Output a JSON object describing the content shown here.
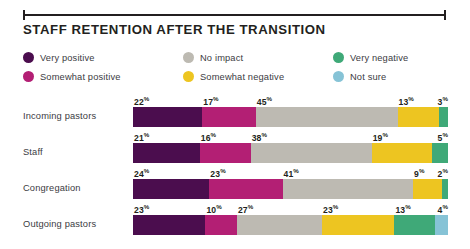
{
  "header": {
    "title": "STAFF RETENTION AFTER THE TRANSITION",
    "rule_color": "#231f20"
  },
  "legend": {
    "columns": [
      {
        "items": [
          {
            "label": "Very positive",
            "color": "#4b0d4e",
            "swatch": "legend-dot-very-positive"
          },
          {
            "label": "Somewhat positive",
            "color": "#b31f74",
            "swatch": "legend-dot-somewhat-positive"
          }
        ]
      },
      {
        "items": [
          {
            "label": "No impact",
            "color": "#bdbab2",
            "swatch": "legend-dot-no-impact"
          },
          {
            "label": "Somewhat negative",
            "color": "#edc521",
            "swatch": "legend-dot-somewhat-negative"
          }
        ]
      },
      {
        "items": [
          {
            "label": "Very negative",
            "color": "#3fa978",
            "swatch": "legend-dot-very-negative"
          },
          {
            "label": "Not sure",
            "color": "#86c3d6",
            "swatch": "legend-dot-not-sure"
          }
        ]
      }
    ]
  },
  "chart_data": {
    "type": "bar",
    "orientation": "horizontal",
    "stacked": true,
    "normalized_percent": true,
    "title": "STAFF RETENTION AFTER THE TRANSITION",
    "xlabel": "",
    "ylabel": "",
    "xlim": [
      0,
      100
    ],
    "grid": false,
    "legend_position": "top",
    "value_suffix": "%",
    "categories": [
      "Incoming pastors",
      "Staff",
      "Congregation",
      "Outgoing pastors"
    ],
    "series": [
      {
        "name": "Very positive",
        "color": "#4b0d4e",
        "values": [
          22,
          21,
          24,
          23
        ]
      },
      {
        "name": "Somewhat positive",
        "color": "#b31f74",
        "values": [
          17,
          16,
          23,
          10
        ]
      },
      {
        "name": "No impact",
        "color": "#bdbab2",
        "values": [
          45,
          38,
          41,
          27
        ]
      },
      {
        "name": "Somewhat negative",
        "color": "#edc521",
        "values": [
          13,
          19,
          9,
          23
        ]
      },
      {
        "name": "Very negative",
        "color": "#3fa978",
        "values": [
          3,
          5,
          2,
          13
        ]
      },
      {
        "name": "Not sure",
        "color": "#86c3d6",
        "values": [
          0,
          0,
          0,
          4
        ]
      }
    ],
    "rows": [
      {
        "label": "Incoming pastors",
        "segments": [
          {
            "name": "Very positive",
            "value": 22,
            "display": "22",
            "color": "#4b0d4e",
            "show_value": true
          },
          {
            "name": "Somewhat positive",
            "value": 17,
            "display": "17",
            "color": "#b31f74",
            "show_value": true
          },
          {
            "name": "No impact",
            "value": 45,
            "display": "45",
            "color": "#bdbab2",
            "show_value": true
          },
          {
            "name": "Somewhat negative",
            "value": 13,
            "display": "13",
            "color": "#edc521",
            "show_value": true
          },
          {
            "name": "Very negative",
            "value": 3,
            "display": "3",
            "color": "#3fa978",
            "show_value": true
          }
        ]
      },
      {
        "label": "Staff",
        "segments": [
          {
            "name": "Very positive",
            "value": 21,
            "display": "21",
            "color": "#4b0d4e",
            "show_value": true
          },
          {
            "name": "Somewhat positive",
            "value": 16,
            "display": "16",
            "color": "#b31f74",
            "show_value": true
          },
          {
            "name": "No impact",
            "value": 38,
            "display": "38",
            "color": "#bdbab2",
            "show_value": true
          },
          {
            "name": "Somewhat negative",
            "value": 19,
            "display": "19",
            "color": "#edc521",
            "show_value": true
          },
          {
            "name": "Very negative",
            "value": 5,
            "display": "5",
            "color": "#3fa978",
            "show_value": true
          }
        ]
      },
      {
        "label": "Congregation",
        "segments": [
          {
            "name": "Very positive",
            "value": 24,
            "display": "24",
            "color": "#4b0d4e",
            "show_value": true
          },
          {
            "name": "Somewhat positive",
            "value": 23,
            "display": "23",
            "color": "#b31f74",
            "show_value": true
          },
          {
            "name": "No impact",
            "value": 41,
            "display": "41",
            "color": "#bdbab2",
            "show_value": true
          },
          {
            "name": "Somewhat negative",
            "value": 9,
            "display": "9",
            "color": "#edc521",
            "show_value": true
          },
          {
            "name": "Very negative",
            "value": 2,
            "display": "2",
            "color": "#3fa978",
            "show_value": true
          }
        ]
      },
      {
        "label": "Outgoing pastors",
        "segments": [
          {
            "name": "Very positive",
            "value": 23,
            "display": "23",
            "color": "#4b0d4e",
            "show_value": true
          },
          {
            "name": "Somewhat positive",
            "value": 10,
            "display": "10",
            "color": "#b31f74",
            "show_value": true
          },
          {
            "name": "No impact",
            "value": 27,
            "display": "27",
            "color": "#bdbab2",
            "show_value": true
          },
          {
            "name": "Somewhat negative",
            "value": 23,
            "display": "23",
            "color": "#edc521",
            "show_value": true
          },
          {
            "name": "Very negative",
            "value": 13,
            "display": "13",
            "color": "#3fa978",
            "show_value": true
          },
          {
            "name": "Not sure",
            "value": 4,
            "display": "4",
            "color": "#86c3d6",
            "show_value": true
          }
        ]
      }
    ]
  }
}
